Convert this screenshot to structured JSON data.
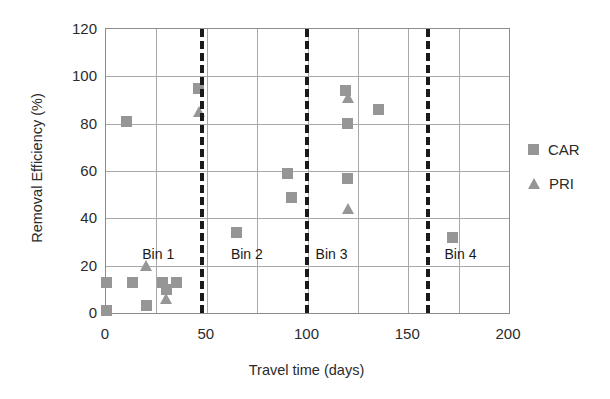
{
  "chart_data": {
    "type": "scatter",
    "title": "",
    "xlabel": "Travel time (days)",
    "ylabel": "Removal Efficiency (%)",
    "xlim": [
      0,
      200
    ],
    "ylim": [
      0,
      120
    ],
    "xticks": [
      0,
      50,
      100,
      150,
      200
    ],
    "yticks": [
      0,
      20,
      40,
      60,
      80,
      100,
      120
    ],
    "grid": true,
    "legend_position": "right",
    "marker_color": "#969696",
    "divider_color": "#1a1a1a",
    "series": [
      {
        "name": "CAR",
        "marker": "square",
        "points": [
          {
            "x": 0,
            "y": 13
          },
          {
            "x": 0,
            "y": 1
          },
          {
            "x": 10,
            "y": 81
          },
          {
            "x": 13,
            "y": 13
          },
          {
            "x": 20,
            "y": 3
          },
          {
            "x": 28,
            "y": 13
          },
          {
            "x": 30,
            "y": 10
          },
          {
            "x": 35,
            "y": 13
          },
          {
            "x": 46,
            "y": 95
          },
          {
            "x": 65,
            "y": 34
          },
          {
            "x": 90,
            "y": 59
          },
          {
            "x": 92,
            "y": 49
          },
          {
            "x": 119,
            "y": 94
          },
          {
            "x": 120,
            "y": 80
          },
          {
            "x": 120,
            "y": 57
          },
          {
            "x": 135,
            "y": 86
          },
          {
            "x": 172,
            "y": 32
          }
        ]
      },
      {
        "name": "PRI",
        "marker": "triangle",
        "points": [
          {
            "x": 20,
            "y": 20
          },
          {
            "x": 30,
            "y": 6
          },
          {
            "x": 46,
            "y": 85
          },
          {
            "x": 120,
            "y": 91
          },
          {
            "x": 120,
            "y": 44
          }
        ]
      }
    ],
    "dividers": [
      {
        "x": 48
      },
      {
        "x": 100
      },
      {
        "x": 160
      }
    ],
    "annotations": [
      {
        "text": "Bin 1",
        "x": 18,
        "y": 25
      },
      {
        "text": "Bin 2",
        "x": 62,
        "y": 25
      },
      {
        "text": "Bin 3",
        "x": 104,
        "y": 25
      },
      {
        "text": "Bin 4",
        "x": 168,
        "y": 25
      }
    ]
  },
  "legend": {
    "items": [
      {
        "label": "CAR",
        "marker": "square"
      },
      {
        "label": "PRI",
        "marker": "triangle"
      }
    ]
  }
}
